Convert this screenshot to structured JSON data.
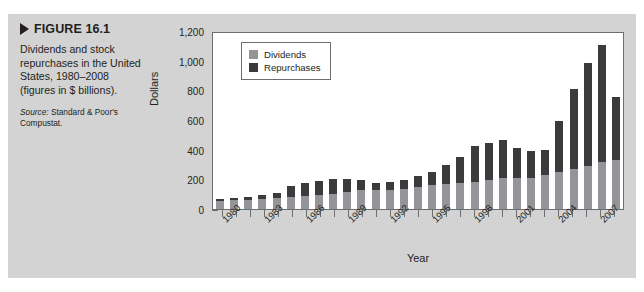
{
  "figure": {
    "number_label": "FIGURE 16.1",
    "caption": "Dividends and stock repurchases in the United States, 1980–2008 (figures in $ billions).",
    "source_label": "Source:",
    "source_text": " Standard & Poor's Compustat."
  },
  "colors": {
    "dividends": "#939598",
    "repurchases": "#3b3b3d",
    "panel_background": "#d3d3d3",
    "plot_background": "#ffffff",
    "axis": "#6d6e71",
    "text": "#231f20"
  },
  "legend": {
    "items": [
      {
        "label": "Dividends",
        "swatch": "#939598"
      },
      {
        "label": "Repurchases",
        "swatch": "#3b3b3d"
      }
    ]
  },
  "chart_data": {
    "type": "bar",
    "stacked": true,
    "title": "Dividends and stock repurchases in the United States, 1980–2008",
    "xlabel": "Year",
    "ylabel": "Dollars",
    "ylim": [
      0,
      1200
    ],
    "yticks": [
      0,
      200,
      400,
      600,
      800,
      1000,
      1200
    ],
    "ytick_labels": [
      "0",
      "200",
      "400",
      "600",
      "800",
      "1,000",
      "1,200"
    ],
    "grid": false,
    "legend_position": "top-left",
    "categories": [
      "1980",
      "1981",
      "1982",
      "1983",
      "1984",
      "1985",
      "1986",
      "1987",
      "1988",
      "1989",
      "1990",
      "1991",
      "1992",
      "1993",
      "1994",
      "1995",
      "1996",
      "1997",
      "1998",
      "1999",
      "2000",
      "2001",
      "2002",
      "2003",
      "2004",
      "2005",
      "2006",
      "2007",
      "2008"
    ],
    "xtick_labels_shown": [
      "1980",
      "1983",
      "1986",
      "1989",
      "1992",
      "1995",
      "1998",
      "2001",
      "2004",
      "2007"
    ],
    "series": [
      {
        "name": "Dividends",
        "color": "#939598",
        "values": [
          52,
          58,
          62,
          70,
          72,
          80,
          86,
          92,
          102,
          115,
          125,
          128,
          130,
          138,
          148,
          160,
          172,
          178,
          185,
          196,
          206,
          208,
          212,
          226,
          252,
          268,
          292,
          320,
          330
        ]
      },
      {
        "name": "Repurchases",
        "color": "#3b3b3d",
        "values": [
          14,
          18,
          22,
          25,
          38,
          72,
          88,
          100,
          98,
          90,
          70,
          48,
          52,
          58,
          72,
          88,
          128,
          172,
          240,
          250,
          262,
          206,
          180,
          174,
          342,
          542,
          690,
          786,
          428
        ]
      }
    ],
    "totals": [
      66,
      76,
      84,
      95,
      110,
      152,
      174,
      192,
      200,
      205,
      195,
      176,
      182,
      196,
      220,
      248,
      300,
      350,
      425,
      446,
      468,
      414,
      392,
      400,
      594,
      810,
      982,
      1106,
      758
    ]
  }
}
